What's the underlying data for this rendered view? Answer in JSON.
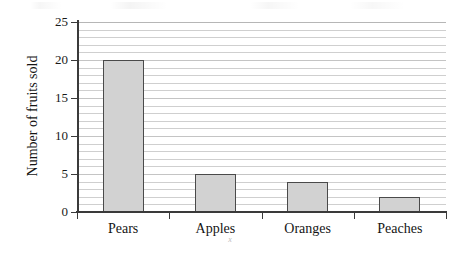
{
  "chart_data": {
    "type": "bar",
    "title": "",
    "subtitle": "",
    "categories": [
      "Pears",
      "Apples",
      "Oranges",
      "Peaches"
    ],
    "values": [
      20,
      5,
      4,
      2
    ],
    "xlabel": "x",
    "ylabel": "Number of fruits sold",
    "ylim": [
      0,
      25
    ],
    "ytick_labels": [
      "0",
      "5",
      "10",
      "15",
      "20",
      "25"
    ],
    "ytick_values": [
      0,
      5,
      10,
      15,
      20,
      25
    ],
    "minor_tick_step": 1,
    "grid": "horizontal",
    "legend": "none",
    "bar_fill_color": "#d2d2d2",
    "bar_border_color": "#4a4a4a",
    "gridline_color": "#cfcfcf",
    "axis_color": "#3a3a3a",
    "background_color": "#ffffff"
  }
}
